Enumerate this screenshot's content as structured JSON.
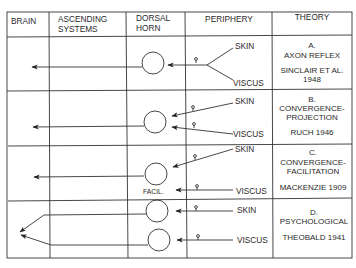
{
  "headers": {
    "brain": "BRAIN",
    "ascending_1": "ASCENDING",
    "ascending_2": "SYSTEMS",
    "dorsal_1": "DORSAL",
    "dorsal_2": "HORN",
    "periphery": "PERIPHERY",
    "theory": "THEORY"
  },
  "rows": [
    {
      "letter": "A.",
      "name_1": "AXON REFLEX",
      "name_2": "",
      "author_1": "SINCLAIR ET AL.",
      "author_2": "1948",
      "skin": "SKIN",
      "viscus": "VISCUS"
    },
    {
      "letter": "B.",
      "name_1": "CONVERGENCE-",
      "name_2": "PROJECTION",
      "author_1": "RUCH 1946",
      "skin": "SKIN",
      "viscus": "VISCUS"
    },
    {
      "letter": "C.",
      "name_1": "CONVERGENCE-",
      "name_2": "FACILITATION",
      "author_1": "MACKENZIE 1909",
      "skin": "SKIN",
      "viscus": "VISCUS",
      "cell_label": "FACIL."
    },
    {
      "letter": "D.",
      "name_1": "PSYCHOLOGICAL",
      "author_1": "THEOBALD 1941",
      "skin": "SKIN",
      "viscus": "VISCUS"
    }
  ],
  "colors": {
    "line": "#333333",
    "text": "#2a2a2a",
    "background": "#ffffff"
  }
}
